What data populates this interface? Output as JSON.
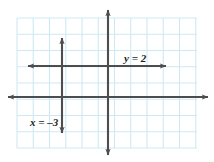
{
  "figure": {
    "name": "coordinate-plane-graph",
    "width": 214,
    "height": 162,
    "background_color": "#ffffff"
  },
  "colors": {
    "grid_line": "#cfe9f2",
    "grid_line_major": "#b9e0ee",
    "axis": "#4d4d4d",
    "graph_line": "#4d4d4d",
    "label_text": "#231f20"
  },
  "grid": {
    "name": "graph-paper-grid",
    "left": 17,
    "top": 18,
    "right": 197,
    "bottom": 148,
    "cell_size": 16.25,
    "columns": 11,
    "rows": 8,
    "visible": true
  },
  "axes": {
    "origin": {
      "x": 108,
      "y": 97
    },
    "x_axis": {
      "label": "x-axis",
      "y": 97,
      "x_start": 8,
      "x_end": 208,
      "arrow_start": true,
      "arrow_end": true
    },
    "y_axis": {
      "label": "y-axis",
      "x": 108,
      "y_start": 10,
      "y_end": 155,
      "arrow_start": true,
      "arrow_end": true
    }
  },
  "chart_data": {
    "type": "line",
    "title": "",
    "xlabel": "",
    "ylabel": "",
    "xlim": [
      -6.6,
      5.5
    ],
    "ylim": [
      -3.5,
      4.9
    ],
    "grid": true,
    "legend": "none",
    "unit_px": 16.25,
    "series": [
      {
        "name": "horizontal-line",
        "equation": "y = 2",
        "label": "y = 2",
        "kind": "horizontal",
        "value": 2,
        "points": [
          [
            -4.9,
            2
          ],
          [
            3.6,
            2
          ]
        ],
        "pixel_y": 66,
        "pixel_x_start": 28,
        "pixel_x_end": 166,
        "arrow_start": true,
        "arrow_end": true,
        "label_position": {
          "x": 124,
          "y": 62
        }
      },
      {
        "name": "vertical-line",
        "equation": "x = -3",
        "label": "x = –3",
        "kind": "vertical",
        "value": -3,
        "points": [
          [
            -3,
            3.6
          ],
          [
            -3,
            -2.2
          ]
        ],
        "pixel_x": 62,
        "pixel_y_start": 38,
        "pixel_y_end": 133,
        "arrow_start": true,
        "arrow_end": true,
        "label_position": {
          "x": 30,
          "y": 126
        }
      }
    ]
  },
  "labels": [
    {
      "name": "label-y-equals-2",
      "text": "y = 2",
      "x": 124,
      "y": 62
    },
    {
      "name": "label-x-equals-neg3",
      "text": "x = –3",
      "x": 30,
      "y": 126
    }
  ]
}
